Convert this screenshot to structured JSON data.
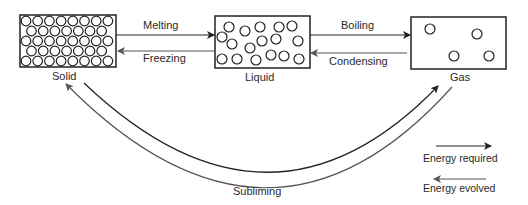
{
  "diagram": {
    "states": [
      {
        "id": "solid",
        "label": "Solid"
      },
      {
        "id": "liquid",
        "label": "Liquid"
      },
      {
        "id": "gas",
        "label": "Gas"
      }
    ],
    "transitions": {
      "melting": "Melting",
      "freezing": "Freezing",
      "boiling": "Boiling",
      "condensing": "Condensing",
      "subliming": "Subliming"
    },
    "legend": {
      "energy_required": "Energy required",
      "energy_evolved": "Energy evolved"
    },
    "colors": {
      "line": "#222222",
      "line_light": "#555555",
      "background": "#ffffff"
    }
  }
}
